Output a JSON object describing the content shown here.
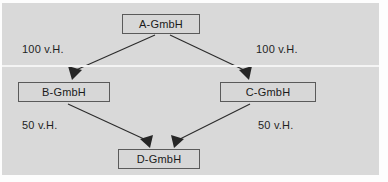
{
  "diagram": {
    "background_color": "#d9d9d9",
    "box_fill_color": "#d7d7d7",
    "box_border_color": "#5a5a5a",
    "line_color": "#2b2b2b",
    "nodes": [
      {
        "id": "a",
        "label": "A-GmbH"
      },
      {
        "id": "b",
        "label": "B-GmbH"
      },
      {
        "id": "c",
        "label": "C-GmbH"
      },
      {
        "id": "d",
        "label": "D-GmbH"
      }
    ],
    "edges": [
      {
        "id": "ab",
        "from": "A-GmbH",
        "to": "B-GmbH",
        "label": "100 v.H."
      },
      {
        "id": "ac",
        "from": "A-GmbH",
        "to": "C-GmbH",
        "label": "100 v.H."
      },
      {
        "id": "bd",
        "from": "B-GmbH",
        "to": "D-GmbH",
        "label": "50 v.H."
      },
      {
        "id": "cd",
        "from": "C-GmbH",
        "to": "D-GmbH",
        "label": "50 v.H."
      }
    ]
  }
}
